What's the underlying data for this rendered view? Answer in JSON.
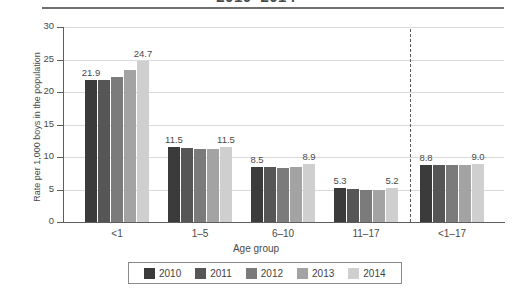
{
  "chart_data": {
    "type": "bar",
    "title": "2010–2014",
    "xlabel": "Age group",
    "ylabel": "Rate per 1,000 boys in the population",
    "ylim": [
      0,
      30
    ],
    "yticks": [
      0,
      5,
      10,
      15,
      20,
      25,
      30
    ],
    "grid": true,
    "legend_position": "bottom",
    "categories": [
      "<1",
      "1–5",
      "6–10",
      "11–17",
      "<1–17"
    ],
    "series": [
      {
        "name": "2010",
        "color": "#3b3b3b",
        "values": [
          21.9,
          11.5,
          8.5,
          5.3,
          8.8
        ]
      },
      {
        "name": "2011",
        "color": "#565656",
        "values": [
          21.9,
          11.4,
          8.4,
          5.1,
          8.8
        ]
      },
      {
        "name": "2012",
        "color": "#7b7b7b",
        "values": [
          22.3,
          11.2,
          8.3,
          5.0,
          8.8
        ]
      },
      {
        "name": "2013",
        "color": "#a3a3a3",
        "values": [
          23.4,
          11.2,
          8.4,
          4.9,
          8.8
        ]
      },
      {
        "name": "2014",
        "color": "#cfcfcf",
        "values": [
          24.7,
          11.5,
          8.9,
          5.2,
          9.0
        ]
      }
    ],
    "value_labels": [
      {
        "group": "<1",
        "text": "21.9",
        "series": "2010"
      },
      {
        "group": "<1",
        "text": "24.7",
        "series": "2014"
      },
      {
        "group": "1–5",
        "text": "11.5",
        "series": "2010"
      },
      {
        "group": "1–5",
        "text": "11.5",
        "series": "2014"
      },
      {
        "group": "6–10",
        "text": "8.5",
        "series": "2010"
      },
      {
        "group": "6–10",
        "text": "8.9",
        "series": "2014"
      },
      {
        "group": "11–17",
        "text": "5.3",
        "series": "2010"
      },
      {
        "group": "11–17",
        "text": "5.2",
        "series": "2014"
      },
      {
        "group": "<1–17",
        "text": "8.8",
        "series": "2010"
      },
      {
        "group": "<1–17",
        "text": "9.0",
        "series": "2014"
      }
    ],
    "annotations": [
      {
        "name": "group-divider",
        "type": "dashed-vertical-line"
      }
    ]
  }
}
